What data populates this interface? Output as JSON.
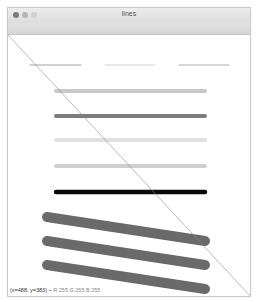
{
  "window": {
    "title": "lines",
    "buttons": [
      {
        "name": "close",
        "color": "#7a7a7a"
      },
      {
        "name": "minimize",
        "color": "#b4b4b4"
      },
      {
        "name": "zoom",
        "color": "#d0d0d0"
      }
    ]
  },
  "canvas": {
    "background": "#ffffff",
    "diagonal": {
      "x1": 0,
      "y1": 0,
      "x2": 244,
      "y2": 263,
      "color": "#8a8a8a",
      "width": 0.6
    },
    "thin_lines": [
      {
        "x1": 22,
        "x2": 73,
        "y": 30,
        "color": "#8c8c8c",
        "width": 0.8
      },
      {
        "x1": 97,
        "x2": 147,
        "y": 30,
        "color": "#b4b4b4",
        "width": 0.6
      },
      {
        "x1": 171,
        "x2": 221,
        "y": 30,
        "color": "#999999",
        "width": 0.8
      }
    ],
    "thick_lines": [
      {
        "x1": 48,
        "y1": 56,
        "x2": 197,
        "y2": 56,
        "color": "#c8c8c8",
        "width": 4
      },
      {
        "x1": 48,
        "y1": 81,
        "x2": 197,
        "y2": 81,
        "color": "#7c7c7c",
        "width": 4
      },
      {
        "x1": 48,
        "y1": 105,
        "x2": 197,
        "y2": 105,
        "color": "#e0e0e0",
        "width": 4
      },
      {
        "x1": 48,
        "y1": 131,
        "x2": 197,
        "y2": 131,
        "color": "#cfcfcf",
        "width": 4
      },
      {
        "x1": 48,
        "y1": 157,
        "x2": 197,
        "y2": 157,
        "color": "#0a0a0a",
        "width": 4.5
      },
      {
        "x1": 39,
        "y1": 182,
        "x2": 197,
        "y2": 206,
        "color": "#6a6a6a",
        "width": 10
      },
      {
        "x1": 39,
        "y1": 206,
        "x2": 197,
        "y2": 230,
        "color": "#6a6a6a",
        "width": 10
      },
      {
        "x1": 39,
        "y1": 230,
        "x2": 197,
        "y2": 254,
        "color": "#6a6a6a",
        "width": 10
      }
    ]
  },
  "status_bar": {
    "coords": "(x=488, y=383) ~",
    "rgb": "R:255 G:255 B:255"
  }
}
